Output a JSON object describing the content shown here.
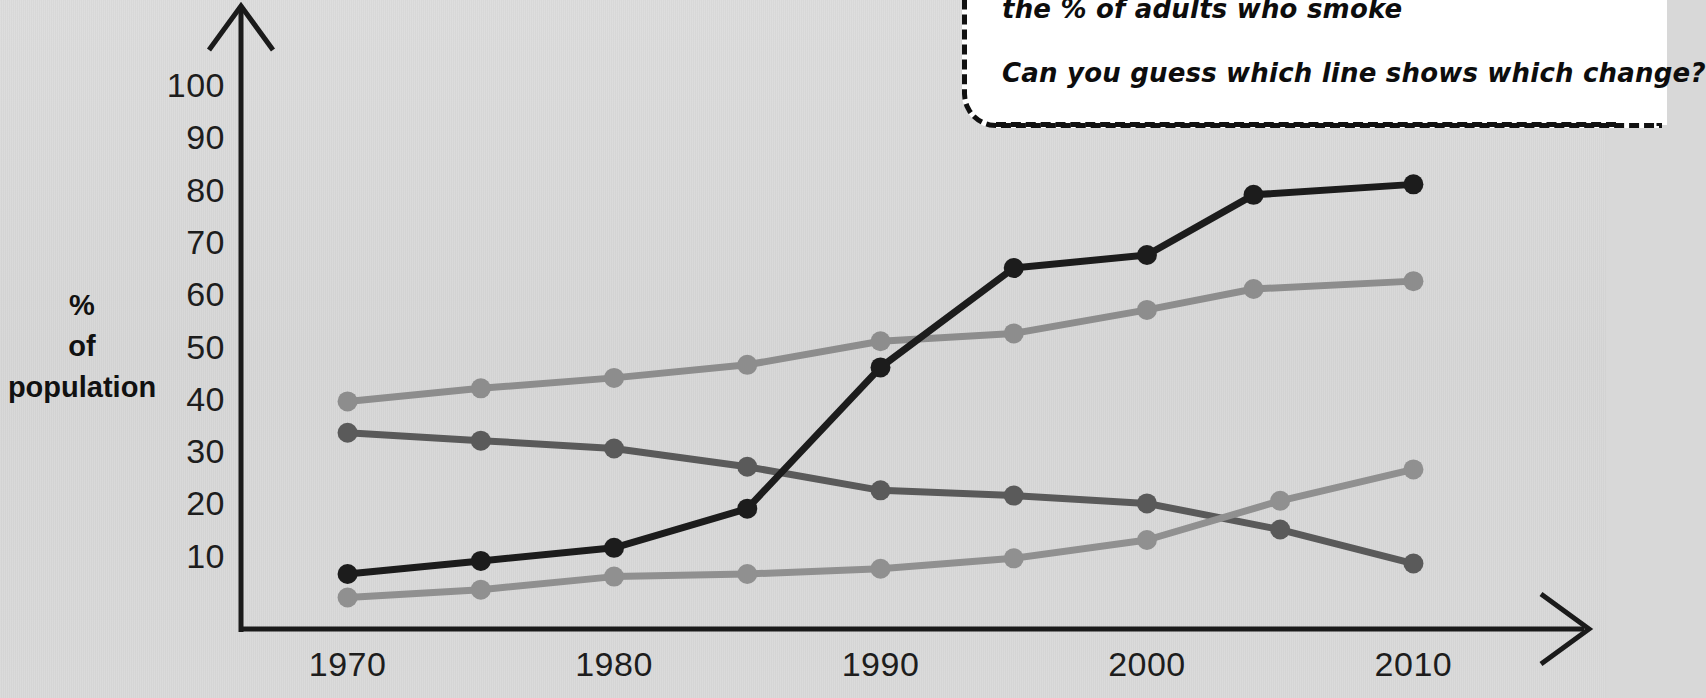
{
  "page": {
    "background_color": "#d9d9d9",
    "ink_color": "#111111"
  },
  "callout": {
    "line1": "the % of adults who smoke",
    "line2": "Can you guess which line shows which change?"
  },
  "chart_data": {
    "type": "line",
    "title": "",
    "xlabel": "",
    "ylabel": "% of population",
    "ylabel_lines": [
      "%",
      "of",
      "population"
    ],
    "x_tick_labels": [
      "1970",
      "1980",
      "1990",
      "2000",
      "2010"
    ],
    "x_tick_values": [
      1970,
      1980,
      1990,
      2000,
      2010
    ],
    "y_tick_labels": [
      "100",
      "90",
      "80",
      "70",
      "60",
      "50",
      "40",
      "30",
      "20",
      "10"
    ],
    "y_tick_values": [
      100,
      90,
      80,
      70,
      60,
      50,
      40,
      30,
      20,
      10
    ],
    "xlim": [
      1966,
      2014
    ],
    "ylim": [
      0,
      103
    ],
    "grid": false,
    "legend": "none",
    "axis_style": "arrows",
    "series": [
      {
        "name": "light-gray-rising-line",
        "color": "#8d8d8d",
        "x": [
          1970,
          1975,
          1980,
          1985,
          1990,
          1995,
          2000,
          2004,
          2010
        ],
        "values": [
          39.5,
          42,
          44,
          46.5,
          51,
          52.5,
          57,
          61,
          62.5
        ]
      },
      {
        "name": "dark-gray-falling-line",
        "color": "#5a5a5a",
        "x": [
          1970,
          1975,
          1980,
          1985,
          1990,
          1995,
          2000,
          2005,
          2010
        ],
        "values": [
          33.5,
          32,
          30.5,
          27,
          22.5,
          21.5,
          20,
          15,
          8.5
        ]
      },
      {
        "name": "black-steep-rising-line",
        "color": "#1c1c1c",
        "x": [
          1970,
          1975,
          1980,
          1985,
          1990,
          1995,
          2000,
          2004,
          2010
        ],
        "values": [
          6.5,
          9,
          11.5,
          19,
          46,
          65,
          67.5,
          79,
          81
        ]
      },
      {
        "name": "mid-gray-low-rising-line",
        "color": "#909090",
        "x": [
          1970,
          1975,
          1980,
          1985,
          1990,
          1995,
          2000,
          2005,
          2010
        ],
        "values": [
          2,
          3.5,
          6,
          6.5,
          7.5,
          9.5,
          13,
          20.5,
          26.5
        ]
      }
    ]
  }
}
